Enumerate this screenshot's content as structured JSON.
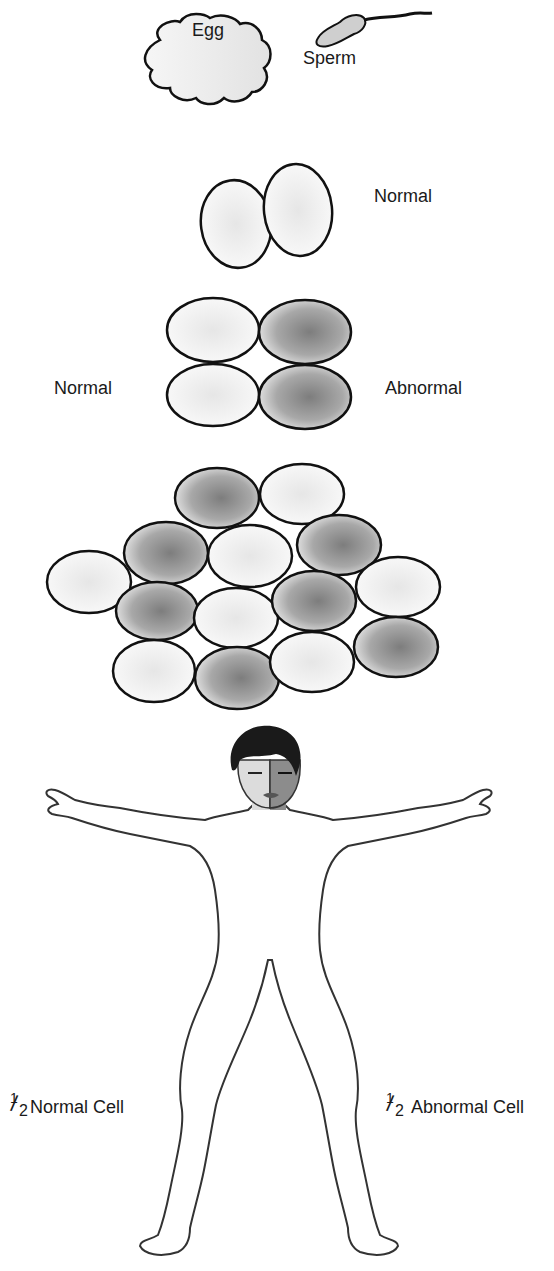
{
  "stages": {
    "fertilization": {
      "egg_label": "Egg",
      "sperm_label": "Sperm"
    },
    "two_cell": {
      "label": "Normal"
    },
    "four_cell": {
      "left_label": "Normal",
      "right_label": "Abnormal"
    },
    "morula": {
      "cell_count": 14,
      "abnormal_count": 7
    },
    "individual": {
      "left_fraction_numerator": "1",
      "left_fraction_denominator": "2",
      "left_label": "Normal Cell",
      "right_fraction_numerator": "1",
      "right_fraction_denominator": "2",
      "right_label": "Abnormal Cell"
    }
  },
  "colors": {
    "outline": "#111111",
    "normal_fill": "#f2f2f2",
    "abnormal_fill": "#8a8a8a",
    "body_normal": "#dcdcdc",
    "body_abnormal": "#8c8c8c",
    "hair": "#1a1a1a"
  }
}
